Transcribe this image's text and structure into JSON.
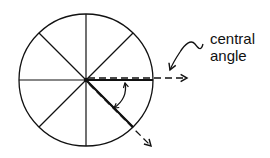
{
  "diagram": {
    "label": {
      "line1": "central",
      "line2": "angle"
    },
    "circle": {
      "cx": 86,
      "cy": 80,
      "rx": 67,
      "ry": 66,
      "sectors": 8
    },
    "colors": {
      "stroke": "#111111",
      "background": "#ffffff"
    },
    "annotations": [
      {
        "type": "dashed-ray",
        "direction": "0deg",
        "description": "horizontal ray from center to the right"
      },
      {
        "type": "dashed-ray",
        "direction": "-45deg",
        "description": "diagonal ray from center down-right"
      },
      {
        "type": "double-arrow-arc",
        "description": "arc between the two rays marking the central angle"
      },
      {
        "type": "pointer-arrow",
        "description": "squiggly arrow from label to the central angle"
      }
    ]
  }
}
